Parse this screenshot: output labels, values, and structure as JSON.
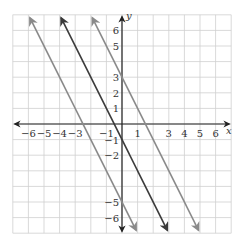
{
  "chart_data": {
    "type": "line",
    "title": "",
    "xlabel": "x",
    "ylabel": "y",
    "xlim": [
      -7,
      7
    ],
    "ylim": [
      -7,
      7
    ],
    "grid": true,
    "x_ticks": [
      "-6",
      "-5",
      "-4",
      "-3",
      "-1",
      "1",
      "3",
      "4",
      "5",
      "6"
    ],
    "y_ticks": [
      "6",
      "5",
      "3",
      "2",
      "1",
      "-1",
      "-2",
      "-5",
      "-6"
    ],
    "series": [
      {
        "name": "y = -2x - 5",
        "slope": -2,
        "intercept": -5,
        "color": "#8a8a8a"
      },
      {
        "name": "y = -2x - 1",
        "slope": -2,
        "intercept": -1,
        "color": "#3a3a3a"
      },
      {
        "name": "y = -2x + 3",
        "slope": -2,
        "intercept": 3,
        "color": "#8a8a8a"
      }
    ]
  },
  "labels": {
    "x": "x",
    "y": "y"
  }
}
